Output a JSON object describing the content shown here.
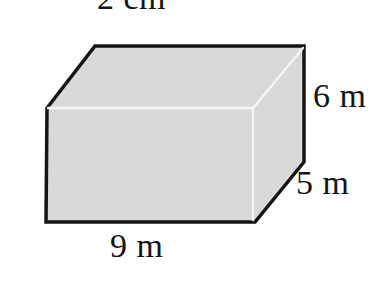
{
  "figure": {
    "shape": "rectangular-prism",
    "labels": {
      "top": "2 cm",
      "height": "6 m",
      "depth": "5 m",
      "base": "9 m"
    },
    "colors": {
      "background": "#ffffff",
      "face_fill": "#d9d9d9",
      "outline": "#141414",
      "inner_edge": "#f6f6f6",
      "text": "#141414"
    }
  }
}
